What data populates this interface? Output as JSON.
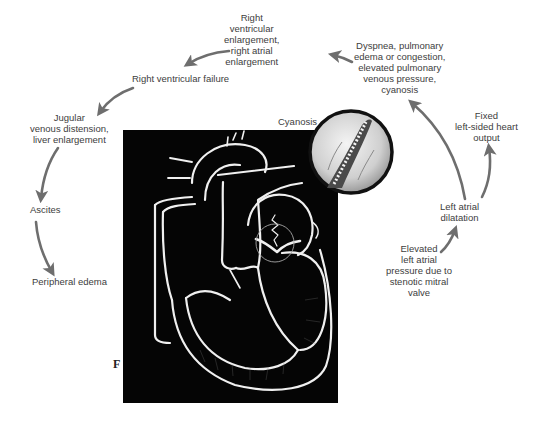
{
  "figure": {
    "panel_letter": "F",
    "colors": {
      "background": "#ffffff",
      "heart_panel": "#050505",
      "heart_outline": "#f2f2f2",
      "arrow": "#6e6e6e",
      "text": "#3d3d3d",
      "inset_border": "#111111",
      "inset_fill": "#d9d9d9"
    }
  },
  "labels": {
    "right_ventricular_enlargement": [
      "Right",
      "ventricular",
      "enlargement,",
      "right atrial",
      "enlargement"
    ],
    "dyspnea": [
      "Dyspnea, pulmonary",
      "edema or congestion,",
      "elevated pulmonary",
      "venous pressure,",
      "cyanosis"
    ],
    "right_ventricular_failure": [
      "Right ventricular failure"
    ],
    "jugular": [
      "Jugular",
      "venous distension,",
      "liver enlargement"
    ],
    "ascites": [
      "Ascites"
    ],
    "peripheral_edema": [
      "Peripheral edema"
    ],
    "cyanosis": [
      "Cyanosis"
    ],
    "fixed_output": [
      "Fixed",
      "left-sided heart",
      "output"
    ],
    "left_atrial_dilatation": [
      "Left atrial",
      "dilatation"
    ],
    "elevated_pressure": [
      "Elevated",
      "left atrial",
      "pressure due to",
      "stenotic mitral",
      "valve"
    ]
  },
  "icons": {
    "heart_illustration": "heart-cross-section-icon",
    "valve_inset": "stenotic-mitral-valve-icon",
    "arrows": "curved-arrow-icon"
  }
}
